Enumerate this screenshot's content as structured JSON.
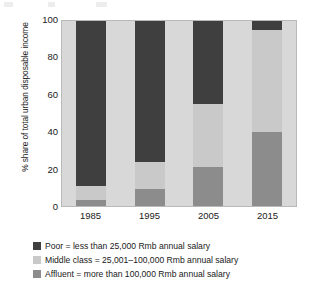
{
  "chart_data": {
    "type": "bar",
    "subtype": "stacked-100-percent",
    "title": "",
    "xlabel": "",
    "ylabel": "% share of total urban disposable income",
    "categories": [
      "1985",
      "1995",
      "2005",
      "2015"
    ],
    "ylim": [
      0,
      100
    ],
    "yticks": [
      "0",
      "20",
      "40",
      "60",
      "80",
      "100"
    ],
    "grid": false,
    "legend_position": "bottom-left",
    "series": [
      {
        "name": "Poor",
        "label": "Poor = less than 25,000 Rmb annual salary",
        "color": "#3f3f3f",
        "values": [
          89,
          76,
          45,
          5
        ]
      },
      {
        "name": "Middle class",
        "label": "Middle class = 25,001–100,000 Rmb annual salary",
        "color": "#c9c9c9",
        "values": [
          8,
          15,
          34,
          55
        ]
      },
      {
        "name": "Affluent",
        "label": "Affluent = more than 100,000 Rmb annual salary",
        "color": "#8c8c8c",
        "values": [
          3,
          9,
          21,
          40
        ]
      }
    ]
  },
  "colors": {
    "poor": "#3f3f3f",
    "middle_class": "#c9c9c9",
    "affluent": "#8c8c8c",
    "plot_background": "#d8d8d8",
    "axis_text": "#1a1a1a"
  },
  "axis": {
    "y_title": "% share of total urban disposable income",
    "y_ticks": [
      "100",
      "80",
      "60",
      "40",
      "20",
      "0"
    ],
    "x_ticks": [
      "1985",
      "1995",
      "2005",
      "2015"
    ]
  },
  "legend": {
    "items": [
      {
        "swatch": "#3f3f3f",
        "label": "Poor = less than 25,000 Rmb annual salary"
      },
      {
        "swatch": "#c9c9c9",
        "label": "Middle class = 25,001–100,000 Rmb annual salary"
      },
      {
        "swatch": "#8c8c8c",
        "label": "Affluent = more than 100,000 Rmb annual salary"
      }
    ]
  }
}
